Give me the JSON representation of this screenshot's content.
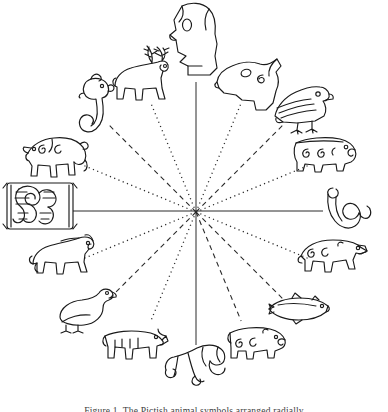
{
  "figure": {
    "caption": "Figure 1. The Pictish animal symbols arranged radially",
    "caption_clipped": true,
    "background_color": "#ffffff",
    "ink_color": "#1a1a1a",
    "center": {
      "x": 196,
      "y": 212
    }
  },
  "axes": [
    {
      "name": "vertical-axis",
      "style": "solid",
      "x1": 196,
      "y1": 82,
      "x2": 196,
      "y2": 345
    },
    {
      "name": "horizontal-axis",
      "style": "solid",
      "x1": 73,
      "y1": 211,
      "x2": 323,
      "y2": 211
    }
  ],
  "spokes": [
    {
      "name": "spoke-nne",
      "angle_deg": 67.5,
      "style": "dotted",
      "length": 118
    },
    {
      "name": "spoke-ne",
      "angle_deg": 45,
      "style": "dashed",
      "length": 124
    },
    {
      "name": "spoke-ene",
      "angle_deg": 22.5,
      "style": "dotted",
      "length": 122
    },
    {
      "name": "spoke-ese",
      "angle_deg": -22.5,
      "style": "dotted",
      "length": 122
    },
    {
      "name": "spoke-se",
      "angle_deg": -45,
      "style": "dashed",
      "length": 124
    },
    {
      "name": "spoke-sse",
      "angle_deg": -67.5,
      "style": "dashed",
      "length": 118
    },
    {
      "name": "spoke-ssw",
      "angle_deg": -112.5,
      "style": "dotted",
      "length": 118
    },
    {
      "name": "spoke-sw",
      "angle_deg": -135,
      "style": "dashed",
      "length": 124
    },
    {
      "name": "spoke-wsw",
      "angle_deg": -157.5,
      "style": "dotted",
      "length": 122
    },
    {
      "name": "spoke-wnw",
      "angle_deg": 157.5,
      "style": "dotted",
      "length": 122
    },
    {
      "name": "spoke-nw",
      "angle_deg": 135,
      "style": "dashed",
      "length": 124
    },
    {
      "name": "spoke-nnw",
      "angle_deg": 112.5,
      "style": "dotted",
      "length": 118
    }
  ],
  "animals": [
    {
      "slot": 1,
      "name": "horse-head",
      "label": "Horse head",
      "position": "top",
      "x": 196,
      "y": 42,
      "w": 62,
      "h": 76
    },
    {
      "slot": 2,
      "name": "ram-head",
      "label": "Ram / deer head",
      "position": "top-right-inner",
      "x": 250,
      "y": 85,
      "w": 66,
      "h": 52
    },
    {
      "slot": 3,
      "name": "eagle",
      "label": "Eagle / bird of prey",
      "position": "upper-right",
      "x": 303,
      "y": 108,
      "w": 58,
      "h": 48
    },
    {
      "slot": 4,
      "name": "boar",
      "label": "Boar / bear",
      "position": "right-upper",
      "x": 327,
      "y": 155,
      "w": 62,
      "h": 40
    },
    {
      "slot": 5,
      "name": "serpent",
      "label": "Serpent",
      "position": "right",
      "x": 349,
      "y": 212,
      "w": 44,
      "h": 52
    },
    {
      "slot": 6,
      "name": "wolf",
      "label": "Wolf / hound",
      "position": "right-lower",
      "x": 333,
      "y": 258,
      "w": 66,
      "h": 42
    },
    {
      "slot": 7,
      "name": "salmon",
      "label": "Salmon / fish",
      "position": "lower-right",
      "x": 300,
      "y": 309,
      "w": 62,
      "h": 28
    },
    {
      "slot": 8,
      "name": "bull",
      "label": "Bull / boar",
      "position": "bottom-right-inner",
      "x": 258,
      "y": 343,
      "w": 58,
      "h": 38
    },
    {
      "slot": 9,
      "name": "beast",
      "label": "Pictish beast",
      "position": "bottom",
      "x": 196,
      "y": 366,
      "w": 62,
      "h": 42
    },
    {
      "slot": 10,
      "name": "cow",
      "label": "Cow / ox",
      "position": "bottom-left-inner",
      "x": 135,
      "y": 344,
      "w": 62,
      "h": 36
    },
    {
      "slot": 11,
      "name": "goose",
      "label": "Goose / swan",
      "position": "lower-left",
      "x": 88,
      "y": 311,
      "w": 58,
      "h": 42
    },
    {
      "slot": 12,
      "name": "horse",
      "label": "Horse",
      "position": "left-lower",
      "x": 63,
      "y": 258,
      "w": 62,
      "h": 42
    },
    {
      "slot": 13,
      "name": "interlace-serpent",
      "label": "Interlaced serpent",
      "position": "left",
      "x": 40,
      "y": 206,
      "w": 70,
      "h": 50
    },
    {
      "slot": 14,
      "name": "lion",
      "label": "Lion / feline",
      "position": "left-upper",
      "x": 58,
      "y": 158,
      "w": 62,
      "h": 44
    },
    {
      "slot": 15,
      "name": "dog-serpent",
      "label": "Dog-headed serpent",
      "position": "upper-left",
      "x": 96,
      "y": 108,
      "w": 40,
      "h": 60
    },
    {
      "slot": 16,
      "name": "stag",
      "label": "Stag / reindeer",
      "position": "top-left-inner",
      "x": 142,
      "y": 80,
      "w": 58,
      "h": 60
    }
  ]
}
